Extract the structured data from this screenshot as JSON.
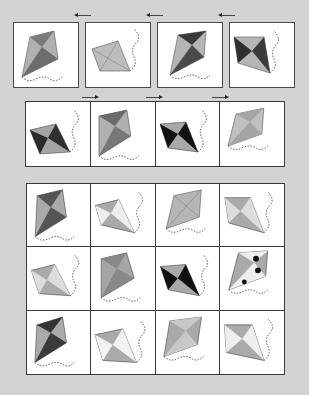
{
  "colors": {
    "background": "#d3d3d3",
    "border": "#3a3a3a",
    "kite_light": "#b8b8b8",
    "kite_mid": "#8e8e8e",
    "kite_dark": "#2a2a2a"
  },
  "top_row": {
    "arrows": [
      {
        "dir": "left"
      },
      {
        "dir": "left"
      },
      {
        "dir": "left"
      }
    ],
    "kites": [
      {
        "pattern": "solid-dark-quadrants",
        "tail": "bottom"
      },
      {
        "pattern": "plain-light",
        "tail": "right"
      },
      {
        "pattern": "diagonal-stripes-dark",
        "tail": "bottom"
      },
      {
        "pattern": "plaid-dark",
        "tail": "right"
      }
    ]
  },
  "middle_row": {
    "arrows": [
      {
        "dir": "right"
      },
      {
        "dir": "right"
      },
      {
        "dir": "right"
      }
    ],
    "kites": [
      {
        "pattern": "black-swirl",
        "tail": "right"
      },
      {
        "pattern": "diagonal-stripes",
        "tail": "bottom"
      },
      {
        "pattern": "solid-black-quadrants",
        "tail": "right"
      },
      {
        "pattern": "plain-light",
        "tail": "bottom"
      }
    ]
  },
  "answer_grid": {
    "rows": 3,
    "cols": 4,
    "kites": [
      {
        "pattern": "checker-dark",
        "tail": "bottom"
      },
      {
        "pattern": "dot-pattern",
        "tail": "right"
      },
      {
        "pattern": "plain-light",
        "tail": "bottom"
      },
      {
        "pattern": "wave-pattern",
        "tail": "right"
      },
      {
        "pattern": "wave-pattern",
        "tail": "right"
      },
      {
        "pattern": "fine-checker",
        "tail": "bottom"
      },
      {
        "pattern": "solid-black-quadrants",
        "tail": "right"
      },
      {
        "pattern": "polka-dots",
        "tail": "bottom"
      },
      {
        "pattern": "dark-swirl",
        "tail": "bottom"
      },
      {
        "pattern": "small-dots",
        "tail": "right"
      },
      {
        "pattern": "plaid-light",
        "tail": "bottom"
      },
      {
        "pattern": "star-print",
        "tail": "right"
      }
    ]
  }
}
